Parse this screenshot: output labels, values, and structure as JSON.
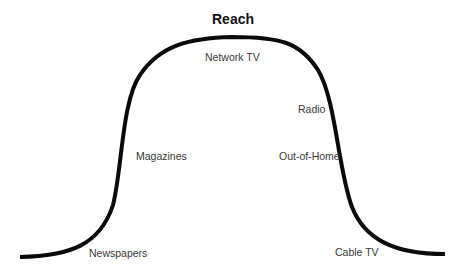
{
  "title": "Reach",
  "curve": {
    "color": "#0a0a0a",
    "stroke_width": 4,
    "path": "M 20 257 C 70 256, 100 245, 113 205 C 122 170, 122 100, 140 75 C 160 45, 190 38, 232 37 C 280 37, 300 42, 318 70 C 336 100, 338 170, 352 207 C 365 240, 395 254, 445 254"
  },
  "labels": [
    {
      "id": "network-tv",
      "text": "Network TV",
      "x": 205,
      "y": 51
    },
    {
      "id": "radio",
      "text": "Radio",
      "x": 298,
      "y": 103
    },
    {
      "id": "magazines",
      "text": "Magazines",
      "x": 136,
      "y": 150
    },
    {
      "id": "out-of-home",
      "text": "Out-of-Home",
      "x": 279,
      "y": 150
    },
    {
      "id": "newspapers",
      "text": "Newspapers",
      "x": 89,
      "y": 247
    },
    {
      "id": "cable-tv",
      "text": "Cable TV",
      "x": 335,
      "y": 246
    }
  ]
}
